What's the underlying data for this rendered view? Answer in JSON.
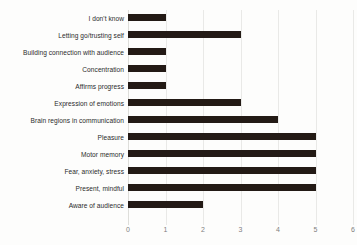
{
  "chart_data": {
    "type": "bar",
    "orientation": "horizontal",
    "title": "",
    "xlabel": "",
    "ylabel": "",
    "xlim": [
      0,
      6
    ],
    "xticks": [
      "0",
      "1",
      "2",
      "3",
      "4",
      "5",
      "6"
    ],
    "grid": true,
    "legend": false,
    "bar_color": "#231a15",
    "gridline_color": "#e9e9e7",
    "tick_label_color": "#80807e",
    "category_label_color": "#2b2b2b",
    "background_color": "#fdfdfc",
    "categories": [
      "I don't know",
      "Letting go/trusting self",
      "Building connection with audience",
      "Concentration",
      "Affirms progress",
      "Expression of emotions",
      "Brain regions in communication",
      "Pleasure",
      "Motor memory",
      "Fear, anxiety, stress",
      "Present, mindful",
      "Aware of audience"
    ],
    "values": [
      1,
      3,
      1,
      1,
      1,
      3,
      4,
      5,
      5,
      5,
      5,
      2
    ]
  }
}
